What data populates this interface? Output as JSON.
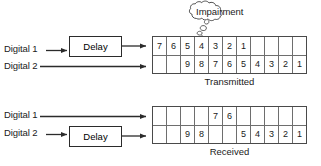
{
  "figure": {
    "sections": [
      {
        "id": "transmitted",
        "caption": "Transmitted",
        "inputs": [
          {
            "label": "Digital 1",
            "has_delay": true,
            "delay_label": "Delay"
          },
          {
            "label": "Digital 2",
            "has_delay": false,
            "delay_label": ""
          }
        ],
        "grid": {
          "columns": 11,
          "rows": [
            {
              "name": "digital-1-stream",
              "cells": [
                "7",
                "6",
                "5",
                "4",
                "3",
                "2",
                "1",
                "",
                "",
                "",
                ""
              ]
            },
            {
              "name": "digital-2-stream",
              "cells": [
                "",
                "",
                "9",
                "8",
                "7",
                "6",
                "5",
                "4",
                "3",
                "2",
                "1"
              ]
            }
          ]
        },
        "annotation": {
          "type": "cloud",
          "label": "Impairment",
          "points_to_column": 5
        }
      },
      {
        "id": "received",
        "caption": "Received",
        "inputs": [
          {
            "label": "Digital 1",
            "has_delay": false,
            "delay_label": ""
          },
          {
            "label": "Digital 2",
            "has_delay": true,
            "delay_label": "Delay"
          }
        ],
        "grid": {
          "columns": 11,
          "rows": [
            {
              "name": "digital-1-stream",
              "cells": [
                "",
                "",
                "",
                "",
                "7",
                "6",
                "",
                "",
                "",
                "",
                ""
              ]
            },
            {
              "name": "digital-2-stream",
              "cells": [
                "",
                "",
                "9",
                "8",
                "",
                "",
                "5",
                "4",
                "3",
                "2",
                "1"
              ]
            }
          ]
        },
        "annotation": null
      }
    ]
  },
  "colors": {
    "line": "#2b2b2b",
    "grid_border": "#4a4a4a",
    "cell_border": "#6e6e6e",
    "text": "#1a1a1a",
    "background": "#ffffff"
  }
}
